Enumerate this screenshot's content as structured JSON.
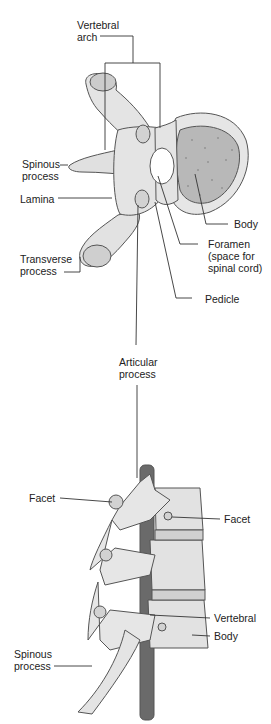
{
  "colors": {
    "bone": "#e4e4e4",
    "bone_shade": "#cfcfcf",
    "bone_outline": "#555555",
    "body_spongy": "#b8b8b8",
    "cord": "#6a6a6a",
    "leader": "#333333"
  },
  "top_view": {
    "labels": {
      "vertebral_arch": "Vertebral\narch",
      "spinous_process": "Spinous\nprocess",
      "lamina": "Lamina",
      "transverse_process": "Transverse\nprocess",
      "body": "Body",
      "foramen": "Foramen\n(space for\nspinal cord)",
      "pedicle": "Pedicle"
    }
  },
  "shared": {
    "articular_process": "Articular\nprocess"
  },
  "side_view": {
    "labels": {
      "facet_left": "Facet",
      "facet_right": "Facet",
      "vertebral": "Vertebral",
      "body": "Body",
      "spinous_process": "Spinous\nprocess"
    }
  }
}
